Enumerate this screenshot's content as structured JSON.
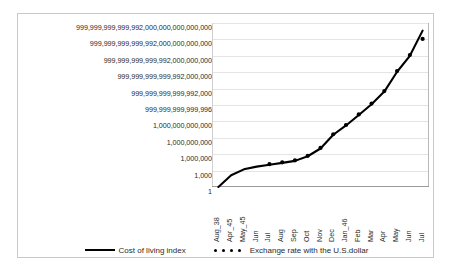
{
  "chart_data": {
    "type": "line",
    "title": "",
    "subtitle": "",
    "xlabel": "",
    "ylabel": "",
    "yscale": "log",
    "ylim": [
      1,
      1e+30
    ],
    "grid": true,
    "legend_position": "bottom",
    "categories": [
      "Aug_38",
      "Apr_45",
      "May_45",
      "Jun",
      "Jul",
      "Aug",
      "Sep",
      "Oct",
      "Nov",
      "Dec",
      "Jan_46",
      "Feb",
      "Mar",
      "Apr",
      "May",
      "Jun",
      "Jul"
    ],
    "y_tick_labels": [
      "999,999,999,999,992,000,000,000,000,000",
      "999,999,999,999,992,000,000,000,000",
      "999,999,999,999,992,000,000,000",
      "999,999,999,999,992,000,000",
      "999,999,999,999,992,000",
      "999,999,999,999,996",
      "1,000,000,000,000",
      "1,000,000,000",
      "1,000,000",
      "1,000",
      "1"
    ],
    "y_tick_values": [
      1e+30,
      1e+27,
      1e+24,
      1e+21,
      1e+18,
      1000000000000000.0,
      1000000000000.0,
      1000000000.0,
      1000000.0,
      1000.0,
      1
    ],
    "series": [
      {
        "name": "Cost of living index",
        "style": "line",
        "color": "#000000",
        "values": [
          1,
          140,
          1700,
          5400,
          12000,
          26000,
          60000,
          420000,
          11000000.0,
          3600000000.0,
          180000000000.0,
          15000000000000.0,
          1400000000000000.0,
          2.8e+17,
          1.2e+21,
          1e+24,
          4e+28
        ]
      },
      {
        "name": "Exchange rate with the U.S.dollar",
        "style": "markers",
        "color": "#000000",
        "values": [
          null,
          null,
          null,
          null,
          15000,
          32000,
          75000,
          500000,
          14000000.0,
          4500000000.0,
          220000000000.0,
          19000000000000.0,
          1800000000000000.0,
          3.5e+17,
          1.6e+21,
          1.4e+24,
          1.2e+27
        ]
      }
    ]
  },
  "legend": {
    "entries": [
      {
        "label": "Cost of living index",
        "marker": "solid-line"
      },
      {
        "label": "Exchange rate with the U.S.dollar",
        "marker": "dotted-markers"
      }
    ]
  }
}
